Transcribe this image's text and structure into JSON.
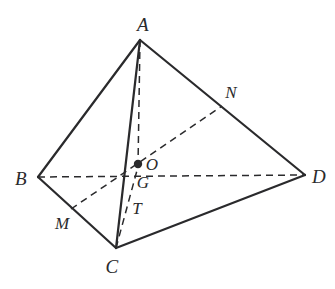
{
  "figure": {
    "type": "geometric-diagram",
    "background_color": "#ffffff",
    "stroke_color": "#2a2a2c",
    "label_color": "#2a2a2c",
    "solid_stroke_width": 2.2,
    "dashed_stroke_width": 1.5,
    "dash_pattern": "7,5",
    "canvas": {
      "width": 335,
      "height": 289
    }
  },
  "vertices": [
    {
      "id": "A",
      "label": "A",
      "x": 140,
      "y": 40,
      "label_x": 143,
      "label_y": 24,
      "kind": "apex"
    },
    {
      "id": "B",
      "label": "B",
      "x": 38,
      "y": 177,
      "label_x": 21,
      "label_y": 178,
      "kind": "base"
    },
    {
      "id": "C",
      "label": "C",
      "x": 116,
      "y": 248,
      "label_x": 112,
      "label_y": 266,
      "kind": "base"
    },
    {
      "id": "D",
      "label": "D",
      "x": 305,
      "y": 175,
      "label_x": 319,
      "label_y": 176,
      "kind": "base"
    }
  ],
  "points": [
    {
      "id": "O",
      "label": "O",
      "x": 138,
      "y": 164,
      "label_x": 152,
      "label_y": 164,
      "marked": true
    },
    {
      "id": "G",
      "label": "G",
      "x": 133,
      "y": 180,
      "label_x": 143,
      "label_y": 182,
      "marked": false
    },
    {
      "id": "T",
      "label": "T",
      "x": 128,
      "y": 203,
      "label_x": 137,
      "label_y": 208,
      "marked": false
    },
    {
      "id": "M",
      "label": "M",
      "x": 71,
      "y": 209,
      "label_x": 62,
      "label_y": 223,
      "marked": false
    },
    {
      "id": "N",
      "label": "N",
      "x": 222,
      "y": 106,
      "label_x": 231,
      "label_y": 92,
      "marked": false
    }
  ],
  "solid_edges": [
    {
      "id": "AB",
      "from": "A",
      "to": "B",
      "x1": 140,
      "y1": 40,
      "x2": 38,
      "y2": 177
    },
    {
      "id": "AC",
      "from": "A",
      "to": "C",
      "x1": 140,
      "y1": 40,
      "x2": 116,
      "y2": 248
    },
    {
      "id": "AD",
      "from": "A",
      "to": "D",
      "x1": 140,
      "y1": 40,
      "x2": 305,
      "y2": 175
    },
    {
      "id": "BC",
      "from": "B",
      "to": "C",
      "x1": 38,
      "y1": 177,
      "x2": 116,
      "y2": 248
    },
    {
      "id": "CD",
      "from": "C",
      "to": "D",
      "x1": 116,
      "y1": 248,
      "x2": 305,
      "y2": 175
    }
  ],
  "dashed_edges": [
    {
      "id": "BD",
      "from": "B",
      "to": "D",
      "x1": 38,
      "y1": 177,
      "x2": 305,
      "y2": 175
    },
    {
      "id": "AO",
      "from": "A",
      "to": "O",
      "x1": 140,
      "y1": 40,
      "x2": 138,
      "y2": 166
    },
    {
      "id": "MN",
      "from": "M",
      "to": "N",
      "x1": 71,
      "y1": 209,
      "x2": 222,
      "y2": 106
    },
    {
      "id": "CO",
      "from": "C",
      "to": "O",
      "x1": 116,
      "y1": 248,
      "x2": 139,
      "y2": 163
    }
  ],
  "marker": {
    "id": "O-dot",
    "x": 138,
    "y": 164,
    "radius": 4.2
  }
}
